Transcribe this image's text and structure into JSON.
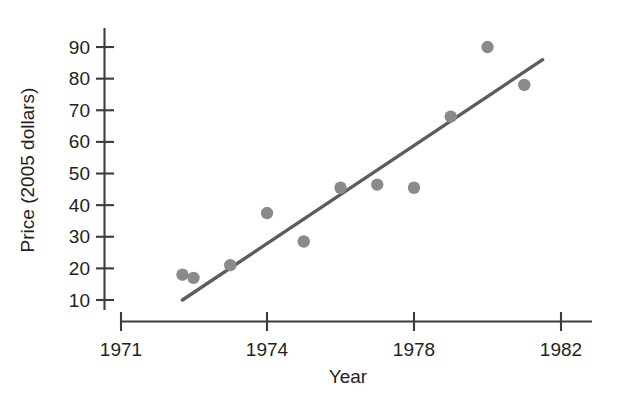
{
  "chart_data": {
    "type": "scatter",
    "title": "",
    "subtitle": "",
    "xlabel": "Year",
    "ylabel": "Price (2005 dollars)",
    "xlim": [
      1971,
      1982
    ],
    "ylim": [
      5,
      95
    ],
    "grid": false,
    "legend": null,
    "xticks": [
      "1971",
      "1974",
      "1978",
      "1982"
    ],
    "xtick_values": [
      1971,
      1974,
      1978,
      1982
    ],
    "yticks": [
      "10",
      "20",
      "30",
      "40",
      "50",
      "60",
      "70",
      "80",
      "90"
    ],
    "ytick_values": [
      10,
      20,
      30,
      40,
      50,
      60,
      70,
      80,
      90
    ],
    "series": [
      {
        "name": "Price observations",
        "marker": "filled-circle",
        "color": "#8a8a8a",
        "x": [
          1971.7,
          1972.0,
          1973.0,
          1974.0,
          1975.0,
          1976.0,
          1977.0,
          1978.0,
          1979.0,
          1980.0,
          1981.0
        ],
        "y": [
          18.0,
          17.0,
          21.0,
          37.5,
          28.5,
          45.5,
          46.5,
          45.5,
          68.0,
          90.0,
          78.0
        ]
      },
      {
        "name": "Least-squares regression line",
        "marker": "line",
        "color": "#5d5d5d",
        "x": [
          1971.7,
          1981.5
        ],
        "y": [
          10.0,
          86.0
        ]
      }
    ],
    "annotations": []
  },
  "axes": {
    "x_axis_title": "Year",
    "y_axis_title": "Price (2005 dollars)"
  },
  "colors": {
    "point": "#8a8a8a",
    "line": "#5d5d5d",
    "axis": "#3b3b3b",
    "text": "#231f20",
    "background": "#ffffff"
  }
}
